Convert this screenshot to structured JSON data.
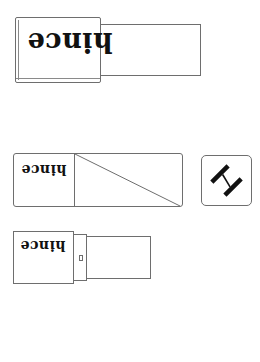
{
  "illustration": {
    "type": "product line drawing",
    "orientation": "upside-down",
    "items": [
      {
        "name": "lipstick-closed",
        "brand": "hince"
      },
      {
        "name": "lipstick-box",
        "brand": "hince"
      },
      {
        "name": "logo-tile",
        "icon": "hince-h-monogram"
      },
      {
        "name": "lipstick-open-cap",
        "brand": "hince"
      }
    ],
    "colors": {
      "stroke": "#6e6e6e",
      "text": "#111111",
      "background": "#ffffff"
    }
  }
}
